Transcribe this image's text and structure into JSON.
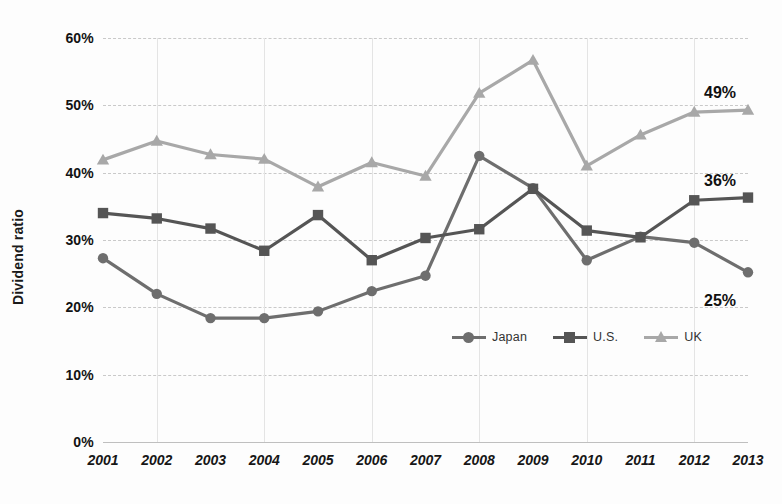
{
  "chart_data": {
    "type": "line",
    "title": "",
    "xlabel": "",
    "ylabel": "Dividend ratio",
    "categories": [
      "2001",
      "2002",
      "2003",
      "2004",
      "2005",
      "2006",
      "2007",
      "2008",
      "2009",
      "2010",
      "2011",
      "2012",
      "2013"
    ],
    "x": [
      2001,
      2002,
      2003,
      2004,
      2005,
      2006,
      2007,
      2008,
      2009,
      2010,
      2011,
      2012,
      2013
    ],
    "ylim": [
      0,
      60
    ],
    "y_ticks": [
      "0%",
      "10%",
      "20%",
      "30%",
      "40%",
      "50%",
      "60%"
    ],
    "y_tick_values": [
      0,
      10,
      20,
      30,
      40,
      50,
      60
    ],
    "y_unit": "%",
    "grid": "horizontal-dashed-and-vertical-solid",
    "legend_position": "inside-bottom-center",
    "series": [
      {
        "name": "Japan",
        "color": "#6e6e6e",
        "marker": "circle",
        "end_label": "25%",
        "values": [
          27.3,
          22.0,
          18.4,
          18.4,
          19.4,
          22.4,
          24.7,
          42.5,
          37.7,
          27.0,
          30.5,
          29.6,
          25.2
        ]
      },
      {
        "name": "U.S.",
        "color": "#555555",
        "marker": "square",
        "end_label": "36%",
        "values": [
          34.0,
          33.2,
          31.7,
          28.4,
          33.7,
          27.0,
          30.3,
          31.6,
          37.6,
          31.4,
          30.4,
          35.9,
          36.3
        ]
      },
      {
        "name": "UK",
        "color": "#a8a8a8",
        "marker": "triangle",
        "end_label": "49%",
        "values": [
          41.9,
          44.7,
          42.7,
          42.0,
          37.9,
          41.5,
          39.5,
          51.8,
          56.7,
          41.0,
          45.6,
          49.0,
          49.3
        ]
      }
    ]
  },
  "legend": {
    "items": [
      {
        "label": "Japan"
      },
      {
        "label": "U.S."
      },
      {
        "label": "UK"
      }
    ]
  },
  "axis": {
    "y_title": "Dividend ratio"
  }
}
